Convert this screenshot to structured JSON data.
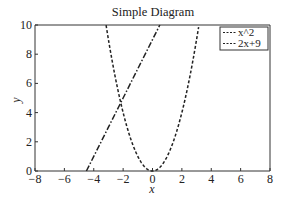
{
  "chart_data": {
    "type": "line",
    "title": "Simple Diagram",
    "xlabel": "x",
    "ylabel": "y",
    "xlim": [
      -8,
      8
    ],
    "ylim": [
      0,
      10
    ],
    "grid": false,
    "legend_position": "upper right",
    "x_ticks": [
      -8,
      -6,
      -4,
      -2,
      0,
      2,
      4,
      6,
      8
    ],
    "x_tick_labels": [
      "−8",
      "−6",
      "−4",
      "−2",
      "0",
      "2",
      "4",
      "6",
      "8"
    ],
    "y_ticks": [
      0,
      2,
      4,
      6,
      8,
      10
    ],
    "y_tick_labels": [
      "0",
      "2",
      "4",
      "6",
      "8",
      "10"
    ],
    "series": [
      {
        "name": "x^2",
        "expression": "x^2",
        "style": "dashed",
        "color": "#222222",
        "x": [
          -3.16,
          -3,
          -2.5,
          -2,
          -1.5,
          -1,
          -0.5,
          0,
          0.5,
          1,
          1.5,
          2,
          2.5,
          3,
          3.16
        ],
        "y": [
          10,
          9,
          6.25,
          4,
          2.25,
          1,
          0.25,
          0,
          0.25,
          1,
          2.25,
          4,
          6.25,
          9,
          10
        ]
      },
      {
        "name": "2x+9",
        "expression": "2x+9",
        "style": "dashdot",
        "color": "#222222",
        "x": [
          -4.5,
          -4,
          -3,
          -2,
          -1,
          0,
          0.5
        ],
        "y": [
          0,
          1,
          3,
          5,
          7,
          9,
          10
        ]
      }
    ],
    "legend": [
      {
        "label": "x^2",
        "marker": "---"
      },
      {
        "label": "2x+9",
        "marker": "---"
      }
    ]
  }
}
